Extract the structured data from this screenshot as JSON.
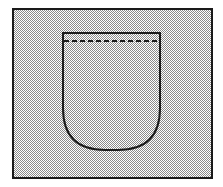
{
  "figure": {
    "kind": "technical-line-drawing",
    "canvas": {
      "width": 223,
      "height": 187,
      "background_color": "#ffffff"
    },
    "frame": {
      "name": "fabric-panel",
      "x": 13,
      "y": 9,
      "width": 199,
      "height": 169,
      "stroke_color": "#1a1a1a",
      "stroke_width": 2,
      "fill_description": "halftone dither, 50% gray screen",
      "fill_color": "#808080",
      "fill_light_color": "#ffffff"
    },
    "pocket": {
      "name": "pocket-outline",
      "x": 63,
      "y": 33,
      "width": 97,
      "height": 117,
      "corner_radius_top": 0,
      "corner_radius_bottom": 42,
      "stroke_color": "#1a1a1a",
      "stroke_width": 2,
      "fill_description": "halftone dither, 50% gray screen"
    },
    "stitch_line": {
      "name": "pocket-hem-stitching",
      "x1": 64,
      "x2": 159,
      "y": 41,
      "stroke_color": "#1a1a1a",
      "stroke_width": 2,
      "dash_length": 5,
      "gap_length": 3
    },
    "labels": {
      "title": "",
      "caption": "",
      "reference_numerals": []
    }
  }
}
